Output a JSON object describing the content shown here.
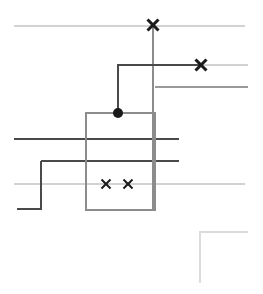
{
  "figure": {
    "width": 263,
    "height": 294,
    "background": "#ffffff"
  },
  "palette": {
    "very_light_gray": "#d8d8d8",
    "light_gray": "#c9c9c9",
    "mid_gray": "#9a9a9a",
    "gray": "#8c8c8c",
    "dark_gray": "#5a5a5a",
    "near_black": "#3a3a3a",
    "marker_black": "#1a1a1a"
  },
  "chart_data": {
    "type": "scatter",
    "title": "",
    "xlabel": "",
    "ylabel": "",
    "xlim": [
      0,
      263
    ],
    "ylim": [
      0,
      294
    ],
    "grid": false,
    "legend": null,
    "markers": [
      {
        "id": "x-top-center",
        "glyph": "x",
        "x": 153,
        "y": 25,
        "size": 11,
        "color": "#1a1a1a"
      },
      {
        "id": "x-upper-right",
        "glyph": "x",
        "x": 201,
        "y": 65,
        "size": 11,
        "color": "#1a1a1a"
      },
      {
        "id": "dot-center",
        "glyph": "dot",
        "x": 118,
        "y": 113,
        "size": 5,
        "color": "#1a1a1a"
      },
      {
        "id": "x-lower-left",
        "glyph": "x",
        "x": 106,
        "y": 184,
        "size": 9,
        "color": "#1a1a1a"
      },
      {
        "id": "x-lower-right",
        "glyph": "x",
        "x": 128,
        "y": 184,
        "size": 9,
        "color": "#1a1a1a"
      }
    ],
    "lines": [
      {
        "id": "hline-top",
        "kind": "horizontal",
        "y": 26,
        "x1": 14,
        "x2": 245,
        "color": "#d2d2d2",
        "width": 2
      },
      {
        "id": "hline-upper-right",
        "kind": "horizontal",
        "y": 65,
        "x1": 201,
        "x2": 248,
        "color": "#d2d2d2",
        "width": 2
      },
      {
        "id": "hline-mid-right",
        "kind": "horizontal",
        "y": 87,
        "x1": 155,
        "x2": 248,
        "color": "#9a9a9a",
        "width": 2
      },
      {
        "id": "hline-dark-upper",
        "kind": "horizontal",
        "y": 139,
        "x1": 14,
        "x2": 179,
        "color": "#4a4a4a",
        "width": 2
      },
      {
        "id": "hline-dark-lower",
        "kind": "horizontal",
        "y": 161,
        "x1": 41,
        "x2": 179,
        "color": "#4a4a4a",
        "width": 2
      },
      {
        "id": "hline-bottom-light",
        "kind": "horizontal",
        "y": 184,
        "x1": 14,
        "x2": 245,
        "color": "#d2d2d2",
        "width": 2
      },
      {
        "id": "vline-center",
        "kind": "vertical",
        "x": 153,
        "y1": 25,
        "y2": 210,
        "color": "#8c8c8c",
        "width": 2
      }
    ],
    "shapes": [
      {
        "id": "center-rectangle",
        "kind": "rect",
        "x": 86,
        "y": 113,
        "w": 69,
        "h": 97,
        "stroke": "#8c8c8c",
        "stroke_width": 2,
        "fill": "none"
      },
      {
        "id": "dark-elbow-polyline",
        "kind": "polyline",
        "points": "118,113 118,65 201,65",
        "stroke": "#4a4a4a",
        "stroke_width": 2,
        "fill": "none"
      },
      {
        "id": "step-polyline-bottom-left",
        "kind": "polyline",
        "points": "17,209 41,209 41,161",
        "stroke": "#4a4a4a",
        "stroke_width": 2,
        "fill": "none"
      },
      {
        "id": "corner-bracket-bottom-right",
        "kind": "polyline",
        "points": "248,232 200,232 200,283",
        "stroke": "#dcdcdc",
        "stroke_width": 2,
        "fill": "none"
      }
    ]
  }
}
